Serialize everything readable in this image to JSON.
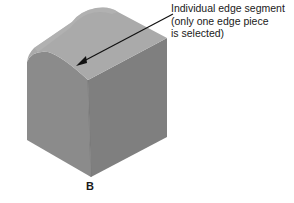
{
  "callout": {
    "lines": [
      "Individual edge segment",
      "(only one edge piece",
      "is selected)"
    ]
  },
  "view_label": "B",
  "colors": {
    "top_face": "#a9a9a9",
    "left_face": "#8a8a8a",
    "right_face": "#7d7d7d",
    "arrow": "#111111"
  }
}
